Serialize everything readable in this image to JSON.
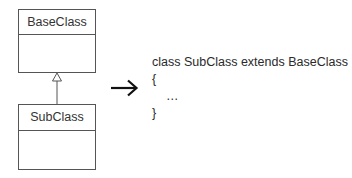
{
  "diagram": {
    "base_class": {
      "name": "BaseClass"
    },
    "sub_class": {
      "name": "SubClass"
    },
    "relationship": "generalization",
    "transform_arrow": "right-arrow"
  },
  "code": {
    "lines": [
      "class SubClass extends BaseClass",
      "{",
      "    …",
      "}"
    ]
  },
  "colors": {
    "line": "#555555",
    "text": "#2a2a2a",
    "arrow": "#111111"
  }
}
